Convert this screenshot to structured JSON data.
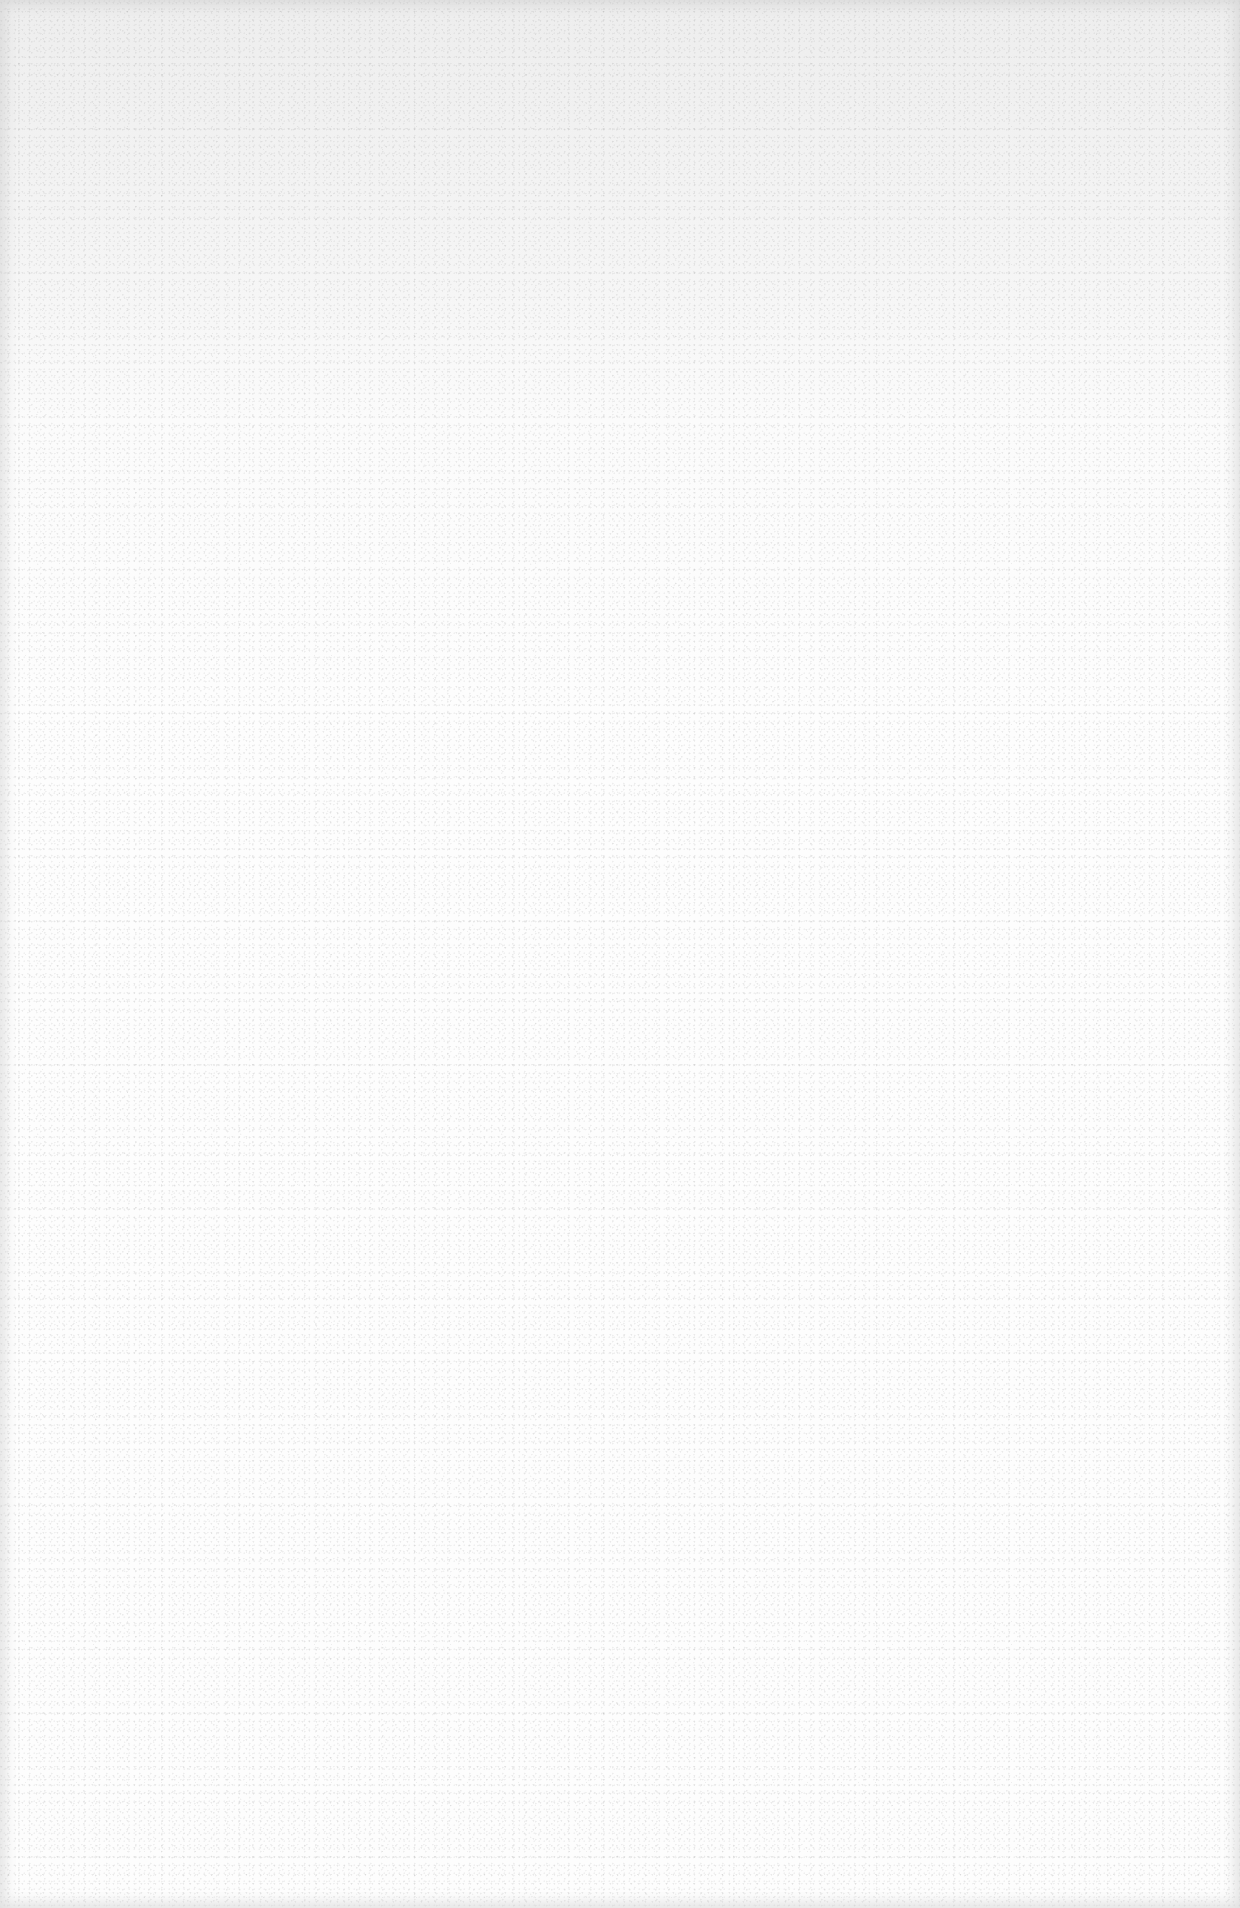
{
  "page": {
    "type": "blank-page",
    "content": [],
    "colors": {
      "paper": "#fdfdfd",
      "upper_tint": "#e8e8e8",
      "edge_shadow": "#c8c8c8"
    }
  }
}
